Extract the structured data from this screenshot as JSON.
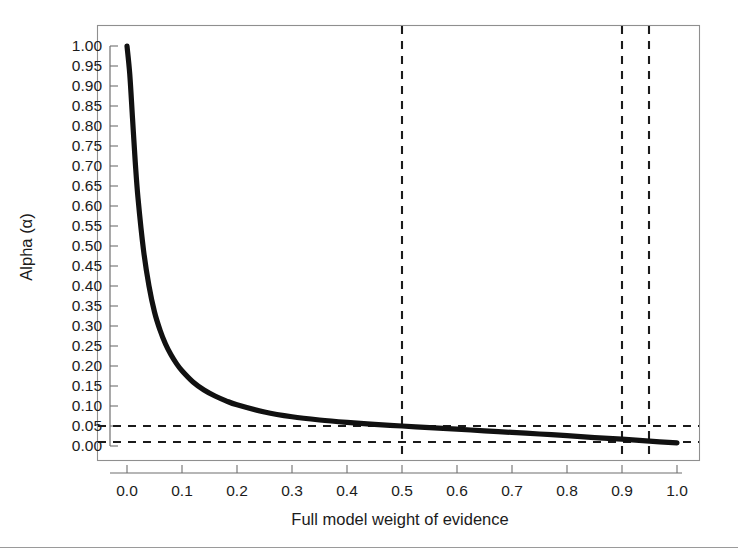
{
  "figure": {
    "background_color": "#ffffff",
    "frame_color": "#8f8f8f",
    "curve_color": "#111111",
    "guide_color": "#1b1b1b",
    "footer_rule": true
  },
  "chart_data": {
    "type": "line",
    "title": "",
    "subtitle": "",
    "xlabel": "Full model weight of evidence",
    "ylabel": "Alpha (α)",
    "xlim": [
      -0.05,
      1.08
    ],
    "ylim": [
      -0.035,
      1.05
    ],
    "grid": false,
    "legend": "none",
    "x_ticks": [
      0.0,
      0.1,
      0.2,
      0.3,
      0.4,
      0.5,
      0.6,
      0.7,
      0.8,
      0.9,
      1.0
    ],
    "x_tick_labels": [
      "0.0",
      "0.1",
      "0.2",
      "0.3",
      "0.4",
      "0.5",
      "0.6",
      "0.7",
      "0.8",
      "0.9",
      "1.0"
    ],
    "y_ticks": [
      0.0,
      0.05,
      0.1,
      0.15,
      0.2,
      0.25,
      0.3,
      0.35,
      0.4,
      0.45,
      0.5,
      0.55,
      0.6,
      0.65,
      0.7,
      0.75,
      0.8,
      0.85,
      0.9,
      0.95,
      1.0
    ],
    "y_tick_labels": [
      "0.00",
      "0.05",
      "0.10",
      "0.15",
      "0.20",
      "0.25",
      "0.30",
      "0.35",
      "0.40",
      "0.45",
      "0.50",
      "0.55",
      "0.60",
      "0.65",
      "0.70",
      "0.75",
      "0.80",
      "0.85",
      "0.90",
      "0.95",
      "1.00"
    ],
    "series": [
      {
        "name": "alpha-vs-weight-of-evidence",
        "x": [
          0.0,
          0.005,
          0.01,
          0.015,
          0.02,
          0.03,
          0.04,
          0.05,
          0.06,
          0.07,
          0.08,
          0.09,
          0.1,
          0.12,
          0.14,
          0.16,
          0.18,
          0.2,
          0.25,
          0.3,
          0.35,
          0.4,
          0.45,
          0.5,
          0.55,
          0.6,
          0.65,
          0.7,
          0.75,
          0.8,
          0.85,
          0.9,
          0.95,
          1.0
        ],
        "y": [
          1.0,
          0.93,
          0.82,
          0.71,
          0.62,
          0.49,
          0.4,
          0.335,
          0.29,
          0.255,
          0.228,
          0.206,
          0.188,
          0.16,
          0.14,
          0.125,
          0.113,
          0.103,
          0.085,
          0.073,
          0.065,
          0.059,
          0.054,
          0.05,
          0.046,
          0.042,
          0.038,
          0.034,
          0.03,
          0.026,
          0.021,
          0.017,
          0.012,
          0.008
        ]
      }
    ],
    "reference_lines": {
      "horizontal": [
        {
          "name": "alpha-0.05-line",
          "value": 0.05,
          "style": "dashed"
        },
        {
          "name": "alpha-0.01-line",
          "value": 0.01,
          "style": "dashed"
        }
      ],
      "vertical": [
        {
          "name": "weight-0.5-line",
          "value": 0.5,
          "style": "dashed"
        },
        {
          "name": "weight-0.9-line",
          "value": 0.9,
          "style": "dashed"
        },
        {
          "name": "weight-0.95-line",
          "value": 0.95,
          "style": "dashed"
        }
      ]
    },
    "annotations": []
  }
}
